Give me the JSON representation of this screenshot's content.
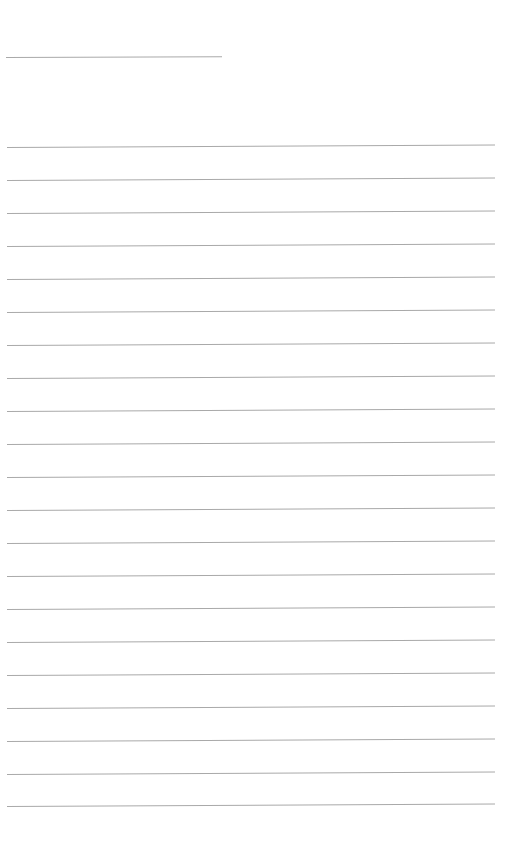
{
  "document": {
    "type": "lined-paper",
    "background_color": "#ffffff",
    "rule_color": "#a9a9a9",
    "header_rule": {
      "x": 6,
      "y": 57,
      "width": 216
    },
    "ruled_lines": {
      "count": 21,
      "x": 7,
      "width": 488,
      "y_positions": [
        147,
        180,
        213,
        246,
        279,
        312,
        345,
        378,
        411,
        444,
        477,
        510,
        543,
        576,
        609,
        642,
        675,
        708,
        741,
        774,
        806
      ]
    },
    "text_content": []
  }
}
